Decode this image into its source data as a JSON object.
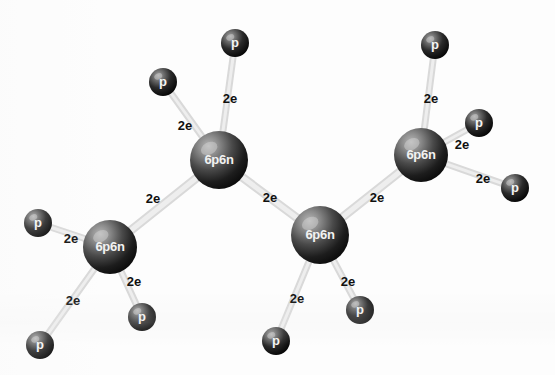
{
  "figure": {
    "background_color": "#fdfdfd",
    "bond_color": "#d9d9d9",
    "carbon_color_light": "#9a9a9a",
    "carbon_color_dark": "#141414",
    "hydrogen_color_light": "#8d8d8d",
    "hydrogen_color_dark": "#0a0a0a",
    "label_color": "#101010",
    "atom_text_color": "#f2f2f2"
  },
  "atoms": [
    {
      "id": "c1",
      "type": "carbon",
      "label": "6p6n",
      "x": 110,
      "y": 247,
      "r": 27
    },
    {
      "id": "c2",
      "type": "carbon",
      "label": "6p6n",
      "x": 219,
      "y": 160,
      "r": 29
    },
    {
      "id": "c3",
      "type": "carbon",
      "label": "6p6n",
      "x": 320,
      "y": 235,
      "r": 29
    },
    {
      "id": "c4",
      "type": "carbon",
      "label": "6p6n",
      "x": 421,
      "y": 155,
      "r": 27
    },
    {
      "id": "h1",
      "type": "hydrogen",
      "label": "p",
      "x": 38,
      "y": 223,
      "r": 14
    },
    {
      "id": "h2",
      "type": "hydrogen",
      "label": "p",
      "x": 40,
      "y": 345,
      "r": 14
    },
    {
      "id": "h3",
      "type": "hydrogen",
      "label": "p",
      "x": 142,
      "y": 317,
      "r": 14
    },
    {
      "id": "h4",
      "type": "hydrogen",
      "label": "p",
      "x": 163,
      "y": 82,
      "r": 14
    },
    {
      "id": "h5",
      "type": "hydrogen",
      "label": "p",
      "x": 235,
      "y": 43,
      "r": 14
    },
    {
      "id": "h6",
      "type": "hydrogen",
      "label": "p",
      "x": 276,
      "y": 341,
      "r": 14
    },
    {
      "id": "h7",
      "type": "hydrogen",
      "label": "p",
      "x": 360,
      "y": 310,
      "r": 14
    },
    {
      "id": "h8",
      "type": "hydrogen",
      "label": "p",
      "x": 435,
      "y": 45,
      "r": 14
    },
    {
      "id": "h9",
      "type": "hydrogen",
      "label": "p",
      "x": 479,
      "y": 123,
      "r": 14
    },
    {
      "id": "h10",
      "type": "hydrogen",
      "label": "p",
      "x": 515,
      "y": 188,
      "r": 14
    }
  ],
  "bonds": [
    {
      "id": "b-c1-c2",
      "from": "c1",
      "to": "c2",
      "label": "2e",
      "label_x": 153,
      "label_y": 200,
      "width": 9
    },
    {
      "id": "b-c2-c3",
      "from": "c2",
      "to": "c3",
      "label": "2e",
      "label_x": 270,
      "label_y": 199,
      "width": 9
    },
    {
      "id": "b-c3-c4",
      "from": "c3",
      "to": "c4",
      "label": "2e",
      "label_x": 377,
      "label_y": 199,
      "width": 9
    },
    {
      "id": "b-c1-h1",
      "from": "c1",
      "to": "h1",
      "label": "2e",
      "label_x": 71,
      "label_y": 240,
      "width": 7
    },
    {
      "id": "b-c1-h2",
      "from": "c1",
      "to": "h2",
      "label": "2e",
      "label_x": 73,
      "label_y": 302,
      "width": 7
    },
    {
      "id": "b-c1-h3",
      "from": "c1",
      "to": "h3",
      "label": "2e",
      "label_x": 134,
      "label_y": 283,
      "width": 7
    },
    {
      "id": "b-c2-h4",
      "from": "c2",
      "to": "h4",
      "label": "2e",
      "label_x": 185,
      "label_y": 127,
      "width": 7
    },
    {
      "id": "b-c2-h5",
      "from": "c2",
      "to": "h5",
      "label": "2e",
      "label_x": 230,
      "label_y": 100,
      "width": 7
    },
    {
      "id": "b-c3-h6",
      "from": "c3",
      "to": "h6",
      "label": "2e",
      "label_x": 297,
      "label_y": 300,
      "width": 7
    },
    {
      "id": "b-c3-h7",
      "from": "c3",
      "to": "h7",
      "label": "2e",
      "label_x": 348,
      "label_y": 283,
      "width": 7
    },
    {
      "id": "b-c4-h8",
      "from": "c4",
      "to": "h8",
      "label": "2e",
      "label_x": 431,
      "label_y": 100,
      "width": 7
    },
    {
      "id": "b-c4-h9",
      "from": "c4",
      "to": "h9",
      "label": "2e",
      "label_x": 462,
      "label_y": 146,
      "width": 7
    },
    {
      "id": "b-c4-h10",
      "from": "c4",
      "to": "h10",
      "label": "2e",
      "label_x": 483,
      "label_y": 180,
      "width": 7
    }
  ]
}
